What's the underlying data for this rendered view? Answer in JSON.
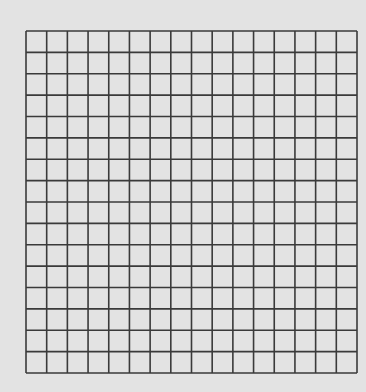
{
  "canvas": {
    "width": 366,
    "height": 392,
    "background": "#e3e3e3"
  },
  "grid": {
    "rows": 16,
    "columns": 16,
    "left": 26,
    "top": 31,
    "width": 331,
    "height": 342,
    "line_color": "#3a3a3a",
    "line_width": 1.6
  }
}
